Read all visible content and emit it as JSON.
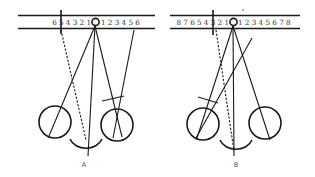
{
  "figure": {
    "panels": [
      {
        "id": "A",
        "label": "A",
        "scale_left": "6 5 4 3 2 1",
        "scale_right": "1 2 3 4 5 6"
      },
      {
        "id": "B",
        "label": "B",
        "scale_left": "8 7 6 5 4 3 2 1",
        "scale_right": "1 2 3 4 5 6 7 8"
      }
    ],
    "colors": {
      "ink": "#1a1a1a",
      "background": "#ffffff"
    }
  }
}
